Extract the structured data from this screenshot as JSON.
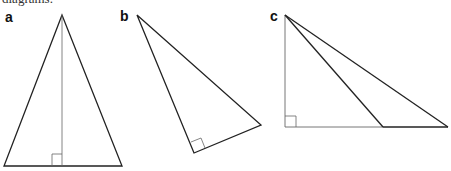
{
  "caption": "diagrams.",
  "colors": {
    "stroke": "#222222",
    "thin_stroke": "#555555",
    "background": "#ffffff"
  },
  "figures": [
    {
      "label": "a",
      "shape": "isosceles triangle with altitude from apex",
      "right_angle_marker": "at foot of altitude on base"
    },
    {
      "label": "b",
      "shape": "right triangle (rotated)",
      "right_angle_marker": "at bottom vertex"
    },
    {
      "label": "c",
      "shape": "right triangle with cevian from top vertex to base",
      "right_angle_marker": "at bottom-left vertex"
    }
  ]
}
